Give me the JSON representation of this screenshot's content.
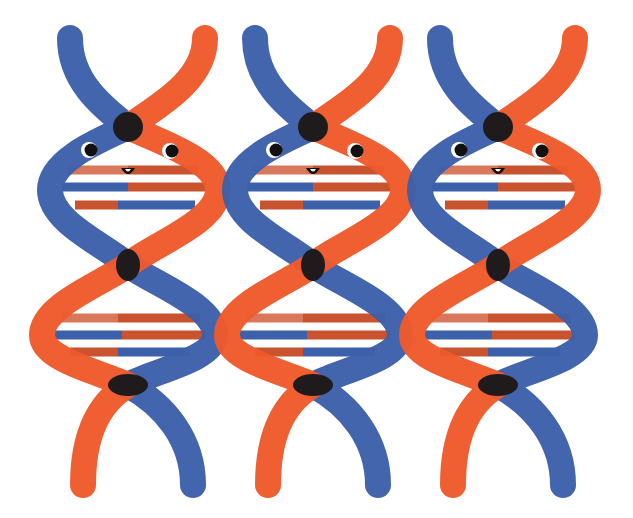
{
  "illustration": {
    "subject": "Three cartoon DNA double helices side by side, each with a smiling face",
    "helix_count": 3,
    "colors": {
      "background": "#ffffff",
      "strand_blue": "#3d60aa",
      "strand_orange": "#ee5a2b",
      "crossing": "#1f1b1c",
      "rung_salmon": "#d8785a",
      "rung_dark_orange": "#c9532f",
      "rung_blue": "#3d60aa",
      "eye_white": "#ffffff",
      "pupil": "#111111"
    },
    "helices": [
      {
        "name": "helix-1",
        "offset_x": 0,
        "has_face": true
      },
      {
        "name": "helix-2",
        "offset_x": 185,
        "has_face": true
      },
      {
        "name": "helix-3",
        "offset_x": 370,
        "has_face": true
      }
    ],
    "face": {
      "eyes": 2,
      "mouth": "small smile"
    }
  }
}
